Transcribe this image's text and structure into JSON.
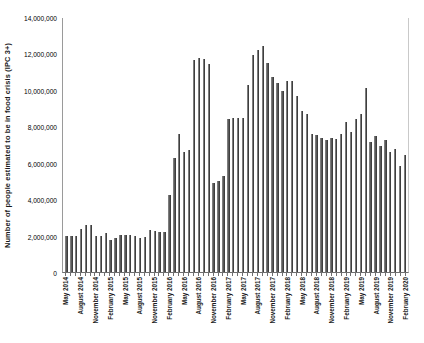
{
  "chart_data": {
    "type": "bar",
    "title": "",
    "subtitle": "",
    "xlabel": "",
    "ylabel": "Number of people estimated to be in food crisis (IPC 3+)",
    "ylim": [
      0,
      14000000
    ],
    "ytick_labels": [
      "14,000,000",
      "12,000,000",
      "10,000,000",
      "8,000,000",
      "6,000,000",
      "4,000,000",
      "2,000,000",
      "0"
    ],
    "ytick_values": [
      14000000,
      12000000,
      10000000,
      8000000,
      6000000,
      4000000,
      2000000,
      0
    ],
    "grid": false,
    "legend": null,
    "legend_position": "none",
    "bar_color": "#595959",
    "axis_color": "#6f6f6f",
    "xtick_label_interval": 3,
    "categories": [
      "May 2014",
      "June 2014",
      "July 2014",
      "August 2014",
      "September 2014",
      "October 2014",
      "November 2014",
      "December 2014",
      "January 2015",
      "February 2015",
      "March 2015",
      "April 2015",
      "May 2015",
      "June 2015",
      "July 2015",
      "August 2015",
      "September 2015",
      "October 2015",
      "November 2015",
      "December 2015",
      "January 2016",
      "February 2016",
      "March 2016",
      "April 2016",
      "May 2016",
      "June 2016",
      "July 2016",
      "August 2016",
      "September 2016",
      "October 2016",
      "November 2016",
      "December 2016",
      "January 2017",
      "February 2017",
      "March 2017",
      "April 2017",
      "May 2017",
      "June 2017",
      "July 2017",
      "August 2017",
      "September 2017",
      "October 2017",
      "November 2017",
      "December 2017",
      "January 2018",
      "February 2018",
      "March 2018",
      "April 2018",
      "May 2018",
      "June 2018",
      "July 2018",
      "August 2018",
      "September 2018",
      "October 2018",
      "November 2018",
      "December 2018",
      "January 2019",
      "February 2019",
      "March 2019",
      "April 2019",
      "May 2019",
      "June 2019",
      "July 2019",
      "August 2019",
      "September 2019",
      "October 2019",
      "November 2019",
      "December 2019",
      "January 2020",
      "February 2020"
    ],
    "xtick_labels_shown": [
      "May 2014",
      "August 2014",
      "November 2014",
      "February 2015",
      "May 2015",
      "August 2015",
      "November 2015",
      "February 2016",
      "May 2016",
      "August 2016",
      "November 2016",
      "February 2017",
      "May 2017",
      "August 2017",
      "November 2017",
      "February 2018",
      "May 2018",
      "August 2018",
      "November 2018",
      "February 2019",
      "May 2019",
      "August 2019",
      "November 2019",
      "February 2020"
    ],
    "values": [
      2000000,
      1980000,
      1980000,
      2350000,
      2600000,
      2580000,
      1950000,
      2000000,
      2150000,
      1780000,
      1880000,
      2050000,
      2050000,
      2050000,
      1950000,
      1880000,
      1900000,
      2300000,
      2250000,
      2200000,
      2200000,
      4250000,
      6250000,
      7550000,
      6600000,
      6700000,
      11650000,
      11750000,
      11700000,
      11400000,
      4900000,
      5000000,
      5250000,
      8400000,
      8450000,
      8450000,
      8450000,
      10250000,
      11900000,
      12200000,
      12400000,
      11500000,
      10700000,
      10350000,
      9950000,
      10500000,
      10500000,
      9650000,
      8850000,
      8700000,
      7550000,
      7500000,
      7350000,
      7250000,
      7350000,
      7300000,
      7550000,
      8250000,
      7700000,
      8400000,
      8700000,
      10100000,
      7150000,
      7450000,
      6900000,
      7250000,
      6600000,
      6750000,
      5800000,
      6450000
    ]
  }
}
